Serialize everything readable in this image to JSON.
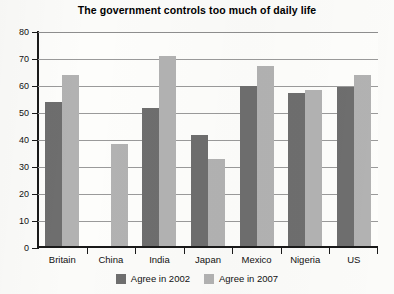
{
  "chart_data": {
    "type": "bar",
    "title": "The government controls too much of daily life",
    "xlabel": "",
    "ylabel": "",
    "ylim": [
      0,
      80
    ],
    "ytick_labels": [
      "80",
      "70",
      "60",
      "50",
      "40",
      "30",
      "20",
      "10",
      "0"
    ],
    "ytick_values": [
      80,
      70,
      60,
      50,
      40,
      30,
      20,
      10,
      0
    ],
    "grid": true,
    "legend_position": "bottom-center",
    "categories": [
      "Britain",
      "China",
      "India",
      "Japan",
      "Mexico",
      "Nigeria",
      "US"
    ],
    "series": [
      {
        "name": "Agree in 2002",
        "color": "#6e6e6e",
        "values": [
          54,
          null,
          52,
          42,
          60,
          57.5,
          59.5
        ]
      },
      {
        "name": "Agree in 2007",
        "color": "#b2b2b2",
        "values": [
          64,
          38.5,
          71,
          33,
          67.5,
          58.5,
          64
        ]
      }
    ]
  },
  "legend": {
    "items": [
      {
        "label": "Agree in 2002"
      },
      {
        "label": "Agree in 2007"
      }
    ]
  }
}
